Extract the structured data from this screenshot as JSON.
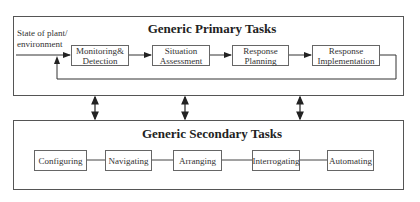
{
  "primary": {
    "title": "Generic Primary Tasks",
    "input_label_line1": "State of plant/",
    "input_label_line2": "environment",
    "boxes": [
      {
        "line1": "Monitoring&",
        "line2": "Detection"
      },
      {
        "line1": "Situation",
        "line2": "Assessment"
      },
      {
        "line1": "Response",
        "line2": "Planning"
      },
      {
        "line1": "Response",
        "line2": "Implementation"
      }
    ]
  },
  "secondary": {
    "title": "Generic Secondary Tasks",
    "boxes": [
      "Configuring",
      "Navigating",
      "Arranging",
      "Interrogating",
      "Automating"
    ]
  }
}
